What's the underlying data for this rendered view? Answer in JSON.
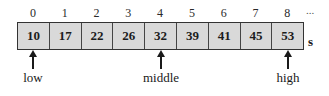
{
  "diagram": {
    "type": "array-binary-search",
    "array_name": "s",
    "indices": [
      "0",
      "1",
      "2",
      "3",
      "4",
      "5",
      "6",
      "7",
      "8"
    ],
    "ellipsis": "...",
    "values": [
      "10",
      "17",
      "22",
      "26",
      "32",
      "39",
      "41",
      "45",
      "53"
    ],
    "pointers": [
      {
        "label": "low",
        "index": 0
      },
      {
        "label": "middle",
        "index": 4
      },
      {
        "label": "high",
        "index": 8
      }
    ]
  }
}
